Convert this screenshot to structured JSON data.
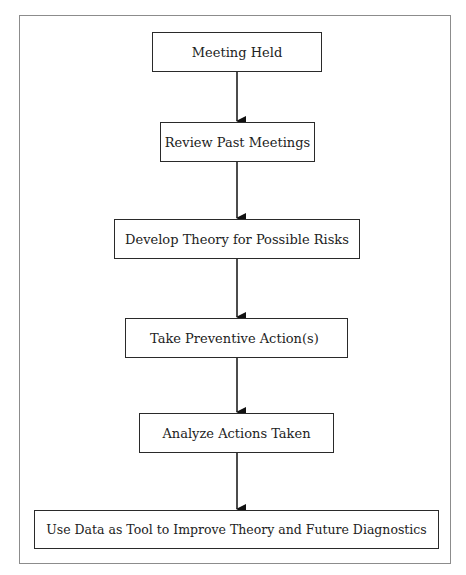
{
  "diagram": {
    "type": "flowchart",
    "direction": "top-to-bottom",
    "colors": {
      "frame_border": "#8c8c8c",
      "box_border": "#2a2a2a",
      "text": "#222222",
      "arrow": "#111111",
      "background": "#ffffff"
    },
    "nodes": [
      {
        "id": "n1",
        "label": "Meeting Held"
      },
      {
        "id": "n2",
        "label": "Review Past Meetings"
      },
      {
        "id": "n3",
        "label": "Develop Theory for Possible Risks"
      },
      {
        "id": "n4",
        "label": "Take Preventive Action(s)"
      },
      {
        "id": "n5",
        "label": "Analyze Actions Taken"
      },
      {
        "id": "n6",
        "label": "Use Data as Tool to Improve Theory and Future Diagnostics"
      }
    ],
    "edges": [
      {
        "from": "n1",
        "to": "n2"
      },
      {
        "from": "n2",
        "to": "n3"
      },
      {
        "from": "n3",
        "to": "n4"
      },
      {
        "from": "n4",
        "to": "n5"
      },
      {
        "from": "n5",
        "to": "n6"
      }
    ]
  }
}
